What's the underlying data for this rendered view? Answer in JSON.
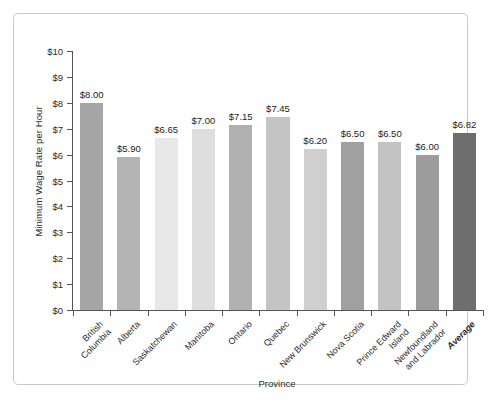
{
  "chart_data": {
    "type": "bar",
    "title": "",
    "xlabel": "Province",
    "ylabel": "Minimum Wage Rate per Hour",
    "ylim": [
      0,
      10
    ],
    "ytick_step": 1,
    "ytick_labels": [
      "$0",
      "$1",
      "$2",
      "$3",
      "$4",
      "$5",
      "$6",
      "$7",
      "$8",
      "$9",
      "$10"
    ],
    "grid": false,
    "legend": "none",
    "value_label_prefix": "$",
    "categories": [
      "British\nColumbia",
      "Alberta",
      "Saskatchewan",
      "Manitoba",
      "Ontario",
      "Quebec",
      "New Brunswick",
      "Nova Scotia",
      "Prince Edward\nIsland",
      "Newfoundland\nand Labrador",
      "Average"
    ],
    "values": [
      8.0,
      5.9,
      6.65,
      7.0,
      7.15,
      7.45,
      6.2,
      6.5,
      6.5,
      6.0,
      6.82
    ],
    "value_labels": [
      "$8.00",
      "$5.90",
      "$6.65",
      "$7.00",
      "$7.15",
      "$7.45",
      "$6.20",
      "$6.50",
      "$6.50",
      "$6.00",
      "$6.82"
    ],
    "bar_colors": [
      "#a6a6a6",
      "#b4b4b4",
      "#e8e8e8",
      "#dedede",
      "#b0b0b0",
      "#c4c4c4",
      "#cfcfcf",
      "#a0a0a0",
      "#c2c2c2",
      "#9c9c9c",
      "#6e6e6e"
    ],
    "emphasis_category": "Average",
    "axis_color": "#555555",
    "text_color": "#2b2b2b",
    "frame_color": "#c9c9c9",
    "background": "#ffffff"
  }
}
